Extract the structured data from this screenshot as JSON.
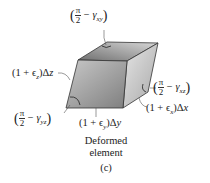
{
  "figure": {
    "labels": {
      "gamma_xy": {
        "num": "π",
        "den": "2",
        "minus": " − ",
        "gamma": "γ",
        "sub": "xy"
      },
      "gamma_xz": {
        "num": "π",
        "den": "2",
        "minus": " − ",
        "gamma": "γ",
        "sub": "xz"
      },
      "gamma_yz": {
        "num": "π",
        "den": "2",
        "minus": " − ",
        "gamma": "γ",
        "sub": "yz"
      },
      "dz": {
        "pre": "(1 + ",
        "eps": "ϵ",
        "sub": "z",
        "post": ")Δ",
        "var": "z"
      },
      "dx": {
        "pre": "(1 + ",
        "eps": "ϵ",
        "sub": "x",
        "post": ")Δ",
        "var": "x"
      },
      "dy": {
        "pre": "(1 + ",
        "eps": "ϵ",
        "sub": "y",
        "post": ")Δ",
        "var": "y"
      }
    },
    "caption": {
      "line1": "Deformed",
      "line2": "element",
      "tag": "(c)"
    },
    "colors": {
      "front_face": "#9a9a9a",
      "top_face": "#8a8a8a",
      "right_face": "#b8b8b8",
      "edge": "#333333"
    }
  }
}
